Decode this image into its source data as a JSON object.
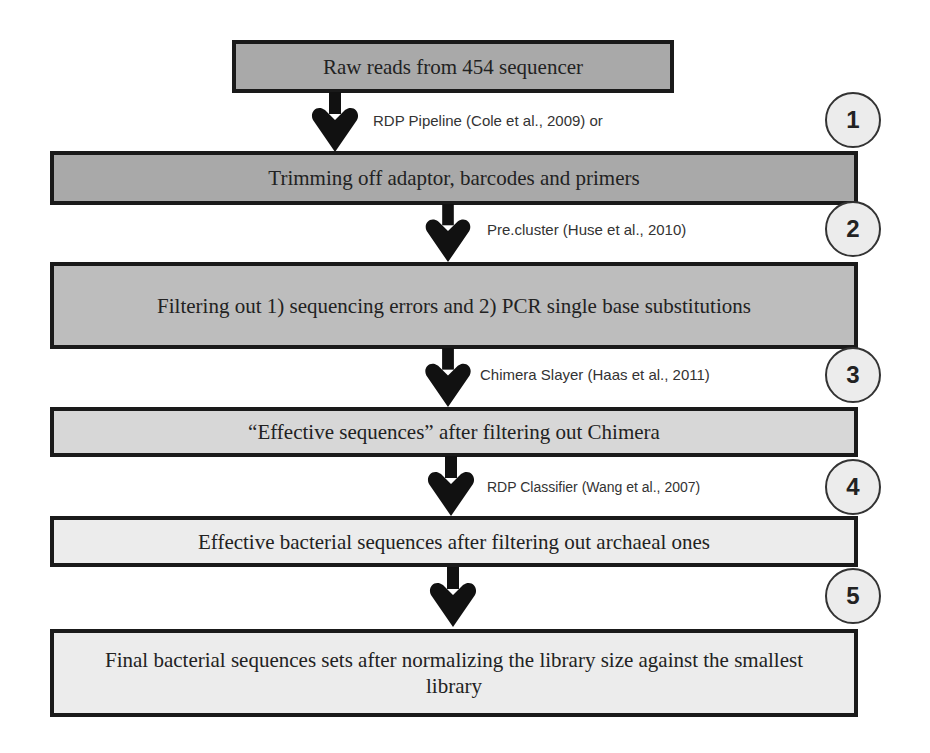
{
  "diagram": {
    "type": "flowchart",
    "direction": "top-to-bottom",
    "boxes": [
      {
        "text": "Raw reads from 454 sequencer",
        "fill": "#a9a9a9"
      },
      {
        "text": "Trimming off adaptor, barcodes and primers",
        "fill": "#a9a9a9"
      },
      {
        "text": "Filtering out 1) sequencing errors and 2) PCR single base substitutions",
        "fill": "#bdbdbd"
      },
      {
        "text": "“Effective sequences” after filtering out Chimera",
        "fill": "#d7d7d7"
      },
      {
        "text": "Effective bacterial sequences after filtering out archaeal ones",
        "fill": "#ececec"
      },
      {
        "text": "Final bacterial sequences sets after normalizing the library size against the smallest library",
        "fill": "#ececec"
      }
    ],
    "steps": [
      {
        "number": "1",
        "label": "RDP Pipeline (Cole et al., 2009) or"
      },
      {
        "number": "2",
        "label": "Pre.cluster (Huse et al., 2010)"
      },
      {
        "number": "3",
        "label": "Chimera Slayer (Haas et al., 2011)"
      },
      {
        "number": "4",
        "label": "RDP Classifier (Wang et al., 2007)"
      },
      {
        "number": "5",
        "label": ""
      }
    ]
  }
}
